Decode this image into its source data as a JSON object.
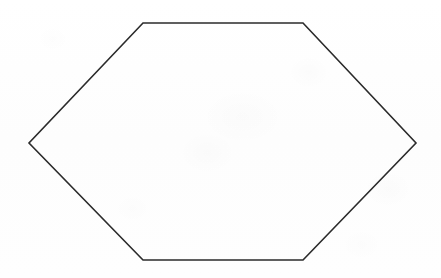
{
  "canvas": {
    "width": 441,
    "height": 278,
    "background_color": "#fefefe",
    "description": "Scanned line drawing of a single hexagon outline on blank white paper"
  },
  "figure": {
    "name": "hexagon",
    "shape_type": "polygon",
    "sides": 6,
    "label": "",
    "stroke_color": "#2b2b2b",
    "stroke_width": 1.6,
    "fill_color": "none",
    "fill": "transparent",
    "orientation": "flat-top",
    "vertices": [
      {
        "id": "top-left",
        "x": 143,
        "y": 23
      },
      {
        "id": "top-right",
        "x": 303,
        "y": 23
      },
      {
        "id": "right",
        "x": 416,
        "y": 143
      },
      {
        "id": "bottom-right",
        "x": 303,
        "y": 260
      },
      {
        "id": "bottom-left",
        "x": 143,
        "y": 260
      },
      {
        "id": "left",
        "x": 29,
        "y": 143
      }
    ],
    "points_attr": "143,23 303,23 416,143 303,260 143,260 29,143",
    "bounds": {
      "left": 29,
      "top": 23,
      "right": 416,
      "bottom": 260,
      "width": 387,
      "height": 237
    },
    "edges": [
      {
        "id": "edge-top",
        "from": "top-left",
        "to": "top-right"
      },
      {
        "id": "edge-upper-right",
        "from": "top-right",
        "to": "right"
      },
      {
        "id": "edge-lower-right",
        "from": "right",
        "to": "bottom-right"
      },
      {
        "id": "edge-bottom",
        "from": "bottom-right",
        "to": "bottom-left"
      },
      {
        "id": "edge-lower-left",
        "from": "bottom-left",
        "to": "left"
      },
      {
        "id": "edge-upper-left",
        "from": "left",
        "to": "top-left"
      }
    ]
  }
}
